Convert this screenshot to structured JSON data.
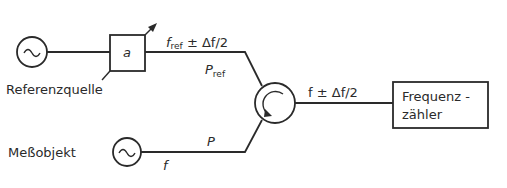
{
  "diagram": {
    "type": "block-diagram",
    "colors": {
      "stroke": "#2a2a2a",
      "background": "#ffffff"
    },
    "nodes": [
      {
        "id": "ref-source",
        "kind": "ac-source",
        "symbol": "~",
        "label": "Referenzquelle"
      },
      {
        "id": "attenuator",
        "kind": "variable-attenuator",
        "symbol": "a"
      },
      {
        "id": "circulator",
        "kind": "mixer-circulator"
      },
      {
        "id": "dut-source",
        "kind": "ac-source",
        "symbol": "~",
        "label": "Meßobjekt"
      },
      {
        "id": "counter",
        "kind": "box",
        "label_line1": "Frequenz -",
        "label_line2": "zähler"
      }
    ],
    "edges": [
      {
        "from": "ref-source",
        "to": "attenuator"
      },
      {
        "from": "attenuator",
        "to": "circulator",
        "label_top": "f",
        "label_top_sub": "ref",
        "label_top_rest": " ± Δf/2",
        "label_bottom": "P",
        "label_bottom_sub": "ref"
      },
      {
        "from": "dut-source",
        "to": "circulator",
        "label_top": "P",
        "label_bottom": "f"
      },
      {
        "from": "circulator",
        "to": "counter",
        "label_top": "f ± Δf/2"
      }
    ]
  }
}
